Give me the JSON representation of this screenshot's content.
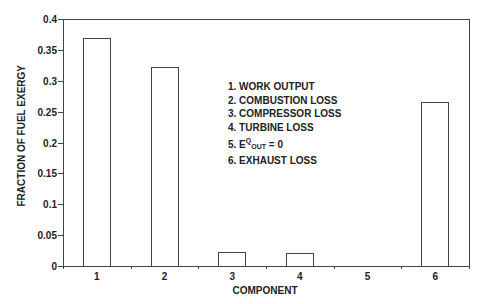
{
  "chart_data": {
    "type": "bar",
    "title": "",
    "xlabel": "COMPONENT",
    "ylabel": "FRACTION OF FUEL EXERGY",
    "categories": [
      "1",
      "2",
      "3",
      "4",
      "5",
      "6"
    ],
    "values": [
      0.369,
      0.322,
      0.023,
      0.021,
      0.0,
      0.266
    ],
    "ylim": [
      0,
      0.4
    ],
    "yticks": [
      "0",
      "0.05",
      "0.1",
      "0.15",
      "0.2",
      "0.25",
      "0.3",
      "0.35",
      "0.4"
    ],
    "grid": false,
    "legend_position": "inside-center",
    "annotations": [
      "1. WORK OUTPUT",
      "2. COMBUSTION LOSS",
      "3. COMPRESSOR LOSS",
      "4. TURBINE LOSS",
      "5. E^Q_OUT = 0",
      "6. EXHAUST LOSS"
    ]
  },
  "legend": {
    "item1": "1. WORK OUTPUT",
    "item2": "2. COMBUSTION LOSS",
    "item3": "3. COMPRESSOR LOSS",
    "item4": "4. TURBINE LOSS",
    "item5_prefix": "5. E",
    "item5_sup": "Q",
    "item5_sub": "OUT",
    "item5_suffix": "= 0",
    "item6": "6. EXHAUST LOSS"
  }
}
